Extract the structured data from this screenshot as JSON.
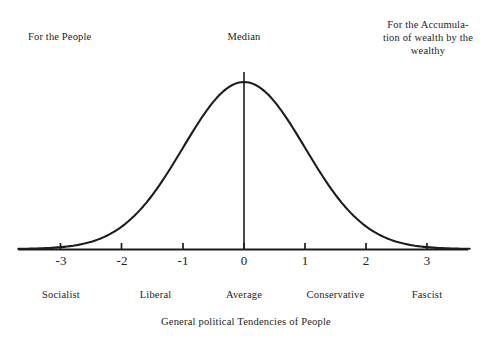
{
  "figure": {
    "caption": "General political Tendencies of People",
    "background_color": "#ffffff",
    "ink_color": "#1c1c1c"
  },
  "annotations": {
    "left": "For the People",
    "center": "Median",
    "right": "For the Accumula-\ntion of wealth by the\nwealthy"
  },
  "chart_data": {
    "type": "line",
    "title": "General political Tendencies of People",
    "subtitle": "",
    "xlabel": "General political Tendencies of People",
    "ylabel": "",
    "xlim": [
      -3.7,
      3.7
    ],
    "ylim": [
      0,
      1.08
    ],
    "grid": false,
    "legend_position": "none",
    "distribution": "normal",
    "mean": 0,
    "std_dev": 1,
    "peak_value": 1.0,
    "xticks": [
      -3,
      -2,
      -1,
      0,
      1,
      2,
      3
    ],
    "xticklabels": [
      "-3",
      "-2",
      "-1",
      "0",
      "1",
      "2",
      "3"
    ],
    "category_ticks": [
      -3,
      -1.45,
      0,
      1.5,
      3
    ],
    "category_labels": [
      "Socialist",
      "Liberal",
      "Average",
      "Conservative",
      "Fascist"
    ],
    "x": [
      -3.4,
      -3.0,
      -2.5,
      -2.0,
      -1.5,
      -1.0,
      -0.5,
      0.0,
      0.5,
      1.0,
      1.5,
      2.0,
      2.5,
      3.0,
      3.4
    ],
    "y": [
      0.003,
      0.011,
      0.044,
      0.135,
      0.325,
      0.607,
      0.882,
      1.0,
      0.882,
      0.607,
      0.325,
      0.135,
      0.044,
      0.011,
      0.003
    ],
    "annotations": [
      {
        "text": "Median",
        "x": 0,
        "position": "top-center"
      },
      {
        "text": "For the People",
        "x": -3,
        "position": "top-left"
      },
      {
        "text": "For the Accumulation of wealth by the wealthy",
        "x": 3,
        "position": "top-right"
      }
    ],
    "median_line": {
      "x": 0,
      "label": "Median",
      "visible": true
    }
  }
}
